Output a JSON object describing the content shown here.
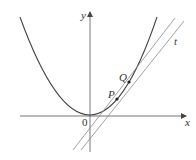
{
  "figure": {
    "axes": {
      "x_label": "x",
      "y_label": "y",
      "origin_label": "0"
    },
    "points": [
      {
        "label": "P"
      },
      {
        "label": "Q"
      }
    ],
    "lines": [
      {
        "label": "t",
        "kind": "tangent"
      },
      {
        "label": "",
        "kind": "secant"
      }
    ],
    "colors": {
      "curve": "#444444",
      "lines": "#777777",
      "axes": "#555555",
      "text": "#333333"
    }
  }
}
